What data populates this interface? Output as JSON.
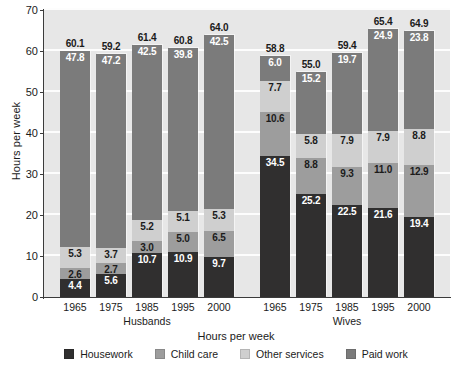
{
  "chart_data": {
    "type": "bar",
    "subtype": "stacked",
    "title": "",
    "xlabel": "Hours per week",
    "ylabel": "Hours per week",
    "ylim": [
      0,
      70
    ],
    "yticks": [
      0,
      10,
      20,
      30,
      40,
      50,
      60,
      70
    ],
    "grid": true,
    "legend_position": "bottom",
    "categories": [
      "1965",
      "1975",
      "1985",
      "1995",
      "2000",
      "1965",
      "1975",
      "1985",
      "1995",
      "2000"
    ],
    "groups": [
      {
        "name": "Husbands",
        "categories": [
          "1965",
          "1975",
          "1985",
          "1995",
          "2000"
        ]
      },
      {
        "name": "Wives",
        "categories": [
          "1965",
          "1975",
          "1985",
          "1995",
          "2000"
        ]
      }
    ],
    "series": [
      {
        "name": "Housework",
        "color": "#302f2f",
        "values": [
          4.4,
          5.6,
          10.7,
          10.9,
          9.7,
          34.5,
          25.2,
          22.5,
          21.6,
          19.4
        ]
      },
      {
        "name": "Child care",
        "color": "#9d9d9d",
        "values": [
          2.6,
          2.7,
          3.0,
          5.0,
          6.5,
          10.6,
          8.8,
          9.3,
          11.0,
          12.9
        ]
      },
      {
        "name": "Other services",
        "color": "#cfcfcf",
        "values": [
          5.3,
          3.7,
          5.2,
          5.1,
          5.3,
          7.7,
          5.8,
          7.9,
          7.9,
          8.8
        ]
      },
      {
        "name": "Paid work",
        "color": "#7b7b7b",
        "values": [
          47.8,
          47.2,
          42.5,
          39.8,
          42.5,
          6.0,
          15.2,
          19.7,
          24.9,
          23.8
        ]
      }
    ],
    "totals": [
      60.1,
      59.2,
      61.4,
      60.8,
      64.0,
      58.8,
      55.0,
      59.4,
      65.4,
      64.9
    ],
    "bars": [
      {
        "group": "Husbands",
        "category": "1965",
        "total": "60.1",
        "segments": [
          {
            "series": "Housework",
            "label": "4.4",
            "value": 4.4,
            "text": "dark"
          },
          {
            "series": "Child care",
            "label": "2.6",
            "value": 2.6,
            "text": "light"
          },
          {
            "series": "Other services",
            "label": "5.3",
            "value": 5.3,
            "text": "light"
          },
          {
            "series": "Paid work",
            "label": "47.8",
            "value": 47.8,
            "text": "dark"
          }
        ]
      },
      {
        "group": "Husbands",
        "category": "1975",
        "total": "59.2",
        "segments": [
          {
            "series": "Housework",
            "label": "5.6",
            "value": 5.6,
            "text": "dark"
          },
          {
            "series": "Child care",
            "label": "2.7",
            "value": 2.7,
            "text": "light"
          },
          {
            "series": "Other services",
            "label": "3.7",
            "value": 3.7,
            "text": "light"
          },
          {
            "series": "Paid work",
            "label": "47.2",
            "value": 47.2,
            "text": "dark"
          }
        ]
      },
      {
        "group": "Husbands",
        "category": "1985",
        "total": "61.4",
        "segments": [
          {
            "series": "Housework",
            "label": "10.7",
            "value": 10.7,
            "text": "dark"
          },
          {
            "series": "Child care",
            "label": "3.0",
            "value": 3.0,
            "text": "light"
          },
          {
            "series": "Other services",
            "label": "5.2",
            "value": 5.2,
            "text": "light"
          },
          {
            "series": "Paid work",
            "label": "42.5",
            "value": 42.5,
            "text": "dark"
          }
        ]
      },
      {
        "group": "Husbands",
        "category": "1995",
        "total": "60.8",
        "segments": [
          {
            "series": "Housework",
            "label": "10.9",
            "value": 10.9,
            "text": "dark"
          },
          {
            "series": "Child care",
            "label": "5.0",
            "value": 5.0,
            "text": "light"
          },
          {
            "series": "Other services",
            "label": "5.1",
            "value": 5.1,
            "text": "light"
          },
          {
            "series": "Paid work",
            "label": "39.8",
            "value": 39.8,
            "text": "dark"
          }
        ]
      },
      {
        "group": "Husbands",
        "category": "2000",
        "total": "64.0",
        "segments": [
          {
            "series": "Housework",
            "label": "9.7",
            "value": 9.7,
            "text": "dark"
          },
          {
            "series": "Child care",
            "label": "6.5",
            "value": 6.5,
            "text": "light"
          },
          {
            "series": "Other services",
            "label": "5.3",
            "value": 5.3,
            "text": "light"
          },
          {
            "series": "Paid work",
            "label": "42.5",
            "value": 42.5,
            "text": "dark"
          }
        ]
      },
      {
        "group": "Wives",
        "category": "1965",
        "total": "58.8",
        "segments": [
          {
            "series": "Housework",
            "label": "34.5",
            "value": 34.5,
            "text": "dark"
          },
          {
            "series": "Child care",
            "label": "10.6",
            "value": 10.6,
            "text": "light"
          },
          {
            "series": "Other services",
            "label": "7.7",
            "value": 7.7,
            "text": "light"
          },
          {
            "series": "Paid work",
            "label": "6.0",
            "value": 6.0,
            "text": "dark"
          }
        ]
      },
      {
        "group": "Wives",
        "category": "1975",
        "total": "55.0",
        "segments": [
          {
            "series": "Housework",
            "label": "25.2",
            "value": 25.2,
            "text": "dark"
          },
          {
            "series": "Child care",
            "label": "8.8",
            "value": 8.8,
            "text": "light"
          },
          {
            "series": "Other services",
            "label": "5.8",
            "value": 5.8,
            "text": "light"
          },
          {
            "series": "Paid work",
            "label": "15.2",
            "value": 15.2,
            "text": "dark"
          }
        ]
      },
      {
        "group": "Wives",
        "category": "1985",
        "total": "59.4",
        "segments": [
          {
            "series": "Housework",
            "label": "22.5",
            "value": 22.5,
            "text": "dark"
          },
          {
            "series": "Child care",
            "label": "9.3",
            "value": 9.3,
            "text": "light"
          },
          {
            "series": "Other services",
            "label": "7.9",
            "value": 7.9,
            "text": "light"
          },
          {
            "series": "Paid work",
            "label": "19.7",
            "value": 19.7,
            "text": "dark"
          }
        ]
      },
      {
        "group": "Wives",
        "category": "1995",
        "total": "65.4",
        "segments": [
          {
            "series": "Housework",
            "label": "21.6",
            "value": 21.6,
            "text": "dark"
          },
          {
            "series": "Child care",
            "label": "11.0",
            "value": 11.0,
            "text": "light"
          },
          {
            "series": "Other services",
            "label": "7.9",
            "value": 7.9,
            "text": "light"
          },
          {
            "series": "Paid work",
            "label": "24.9",
            "value": 24.9,
            "text": "dark"
          }
        ]
      },
      {
        "group": "Wives",
        "category": "2000",
        "total": "64.9",
        "segments": [
          {
            "series": "Housework",
            "label": "19.4",
            "value": 19.4,
            "text": "dark"
          },
          {
            "series": "Child care",
            "label": "12.9",
            "value": 12.9,
            "text": "light"
          },
          {
            "series": "Other services",
            "label": "8.8",
            "value": 8.8,
            "text": "light"
          },
          {
            "series": "Paid work",
            "label": "23.8",
            "value": 23.8,
            "text": "dark"
          }
        ]
      }
    ],
    "legend": [
      {
        "label": "Housework",
        "color": "#302f2f"
      },
      {
        "label": "Child care",
        "color": "#9d9d9d"
      },
      {
        "label": "Other services",
        "color": "#cfcfcf"
      },
      {
        "label": "Paid work",
        "color": "#7b7b7b"
      }
    ],
    "colors": {
      "plot_background": "#e7e7e7",
      "gridline": "#fdfdfd",
      "axis": "#3b3b3b",
      "text": "#1b1b1b"
    }
  }
}
